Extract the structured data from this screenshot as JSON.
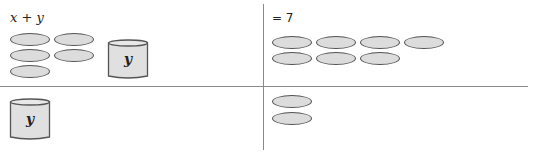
{
  "panels": {
    "top_left": {
      "expression": "x + y",
      "counters": 5,
      "cup_label": "y"
    },
    "top_right": {
      "expression": "= 7",
      "counters": 7
    },
    "bottom_left": {
      "cup_label": "y"
    },
    "bottom_right": {
      "counters": 2
    }
  },
  "colors": {
    "counter_fill": "#dcdcdc",
    "counter_stroke": "#555555",
    "cup_fill": "#e0e0e0",
    "divider": "#8a8a8a"
  }
}
